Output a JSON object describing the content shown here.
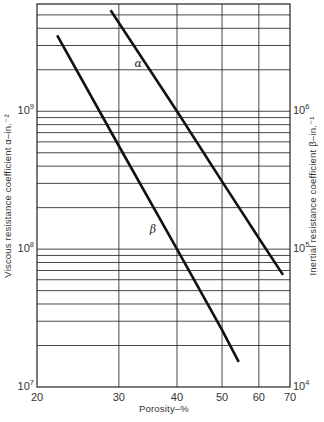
{
  "chart_data": {
    "type": "line",
    "title": "",
    "xlabel": "Porosity–%",
    "ylabel_left": "Viscous resistance coefficient α–in.⁻²",
    "ylabel_right": "Inertial resistance coefficient β–in.⁻¹",
    "x_scale": "log",
    "y_scale": "log",
    "xlim": [
      20,
      70
    ],
    "ylim_left": [
      10000000.0,
      6000000000.0
    ],
    "ylim_right": [
      10000.0,
      6000000.0
    ],
    "x_ticks": [
      20,
      30,
      40,
      50,
      60,
      70
    ],
    "x_tick_labels": [
      "20",
      "30",
      "40",
      "50",
      "60",
      "70"
    ],
    "y_ticks_left": [
      {
        "value": 10000000.0,
        "base": "10",
        "exp": "7"
      },
      {
        "value": 100000000.0,
        "base": "10",
        "exp": "8"
      },
      {
        "value": 1000000000.0,
        "base": "10",
        "exp": "9"
      }
    ],
    "y_ticks_right": [
      {
        "value": 10000.0,
        "base": "10",
        "exp": "4"
      },
      {
        "value": 100000.0,
        "base": "10",
        "exp": "5"
      },
      {
        "value": 1000000.0,
        "base": "10",
        "exp": "6"
      }
    ],
    "y_minor_gridlines_left": [
      20000000.0,
      30000000.0,
      40000000.0,
      50000000.0,
      60000000.0,
      70000000.0,
      80000000.0,
      90000000.0,
      200000000.0,
      300000000.0,
      400000000.0,
      500000000.0,
      600000000.0,
      700000000.0,
      800000000.0,
      900000000.0,
      2000000000.0,
      3000000000.0,
      4000000000.0,
      5000000000.0
    ],
    "grid": true,
    "legend": "none (inline labels)",
    "series": [
      {
        "name": "α",
        "axis": "left",
        "label_position": {
          "x": 33,
          "y": 2100000000.0
        },
        "x": [
          28.8,
          40,
          50,
          60,
          67.6
        ],
        "values": [
          5400000000.0,
          1000000000.0,
          310000000.0,
          120000000.0,
          65000000.0
        ]
      },
      {
        "name": "β",
        "axis": "right",
        "label_position": {
          "x": 35.5,
          "y": 130000.0
        },
        "x": [
          22.1,
          30,
          40,
          50,
          54.3
        ],
        "values": [
          3560000.0,
          560000.0,
          100000.0,
          26000.0,
          15200.0
        ]
      }
    ]
  }
}
